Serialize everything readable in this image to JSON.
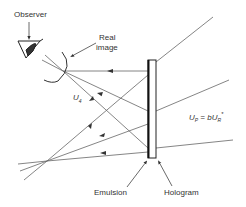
{
  "diagram": {
    "type": "hologram-reconstruction-real-image",
    "labels": {
      "observer": "Observer",
      "real_image_line1": "Real",
      "real_image_line2": "image",
      "u4": "U",
      "u4_sub": "4",
      "up_eq_main": "U",
      "up_sub": "P",
      "up_eq_mid": " = bU",
      "ur_sub": "R",
      "up_eq_star": "*",
      "emulsion": "Emulsion",
      "hologram": "Hologram"
    },
    "colors": {
      "line": "#555555",
      "plate": "#222222",
      "text": "#333333"
    }
  }
}
